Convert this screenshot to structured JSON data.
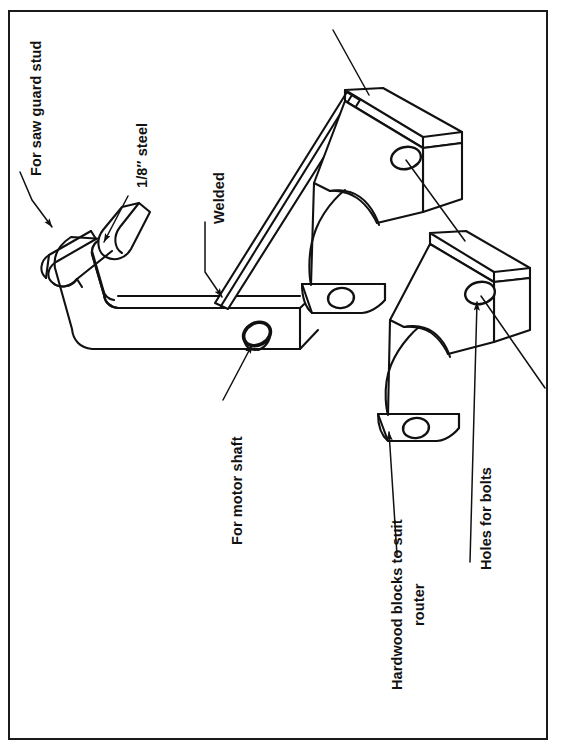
{
  "document": {
    "type": "technical line drawing",
    "subject": "Router mounting bracket and hardwood blocks",
    "frame": {
      "border_color": "#1a1a1a",
      "background": "#ffffff"
    },
    "line_color": "#111111",
    "text_color": "#111111",
    "text_orientation": "rotated -90 degrees (reads bottom-to-top)"
  },
  "labels": {
    "saw_guard_stud": "For saw guard stud",
    "steel_gauge": "1/8″ steel",
    "welded": "Welded",
    "motor_shaft": "For motor shaft",
    "hardwood_blocks_line1": "Hardwood blocks to suit",
    "hardwood_blocks_line2": "router",
    "holes_for_bolts": "Holes for bolts"
  },
  "parts": {
    "bracket": {
      "name": "steel bracket",
      "material": "1/8″ steel",
      "features": [
        "U-shaped slot for saw guard stud",
        "welded joint",
        "hole for motor shaft"
      ]
    },
    "upper_block": {
      "name": "upper hardwood block",
      "features": [
        "semicircular router cutout",
        "bolt hole top face",
        "bolt hole lower flange"
      ]
    },
    "lower_block": {
      "name": "lower hardwood block",
      "features": [
        "semicircular router cutout",
        "bolt hole top face",
        "bolt hole lower flange"
      ]
    }
  },
  "callouts": [
    {
      "id": "saw-guard-stud",
      "target": "bracket slot",
      "arrow": "filled"
    },
    {
      "id": "steel-gauge",
      "target": "bracket upright web",
      "arrow": "filled"
    },
    {
      "id": "welded",
      "target": "bracket weld joint",
      "arrow": "filled"
    },
    {
      "id": "motor-shaft",
      "target": "bracket shaft hole",
      "arrow": "filled"
    },
    {
      "id": "hardwood-blocks",
      "target": "lower block corner",
      "arrow": "filled"
    },
    {
      "id": "holes-for-bolts",
      "target": "lower block bolt hole",
      "arrow": "filled"
    },
    {
      "id": "upper-block-plain",
      "target": "upper block top face",
      "arrow": "none"
    },
    {
      "id": "upper-block-hole-plain",
      "target": "upper block bolt hole",
      "arrow": "none"
    }
  ]
}
